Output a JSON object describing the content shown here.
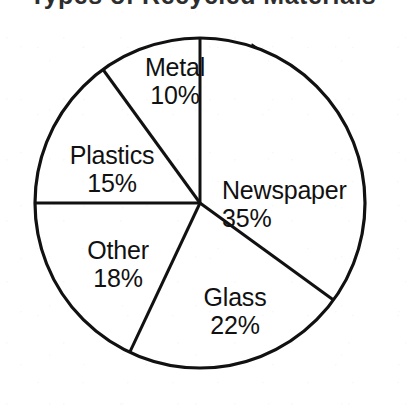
{
  "figure": {
    "title_fragment": "Types of Recycled Materials",
    "title_visible": false,
    "background_color": "#ffffff",
    "ink_color": "#111111"
  },
  "chart_data": {
    "type": "pie",
    "title": "",
    "xlabel": "",
    "ylabel": "",
    "grid": false,
    "legend": "none",
    "labels_inside_slices": true,
    "value_suffix": "%",
    "total": 100,
    "start_angle_deg": 0,
    "direction": "clockwise",
    "categories": [
      "Newspaper",
      "Glass",
      "Other",
      "Plastics",
      "Metal"
    ],
    "values": [
      35,
      22,
      18,
      15,
      10
    ],
    "slices": [
      {
        "name": "Newspaper",
        "value": 35,
        "value_label": "35%",
        "start_deg": 0,
        "end_deg": 126,
        "fill": "#ffffff",
        "stroke": "#111111"
      },
      {
        "name": "Glass",
        "value": 22,
        "value_label": "22%",
        "start_deg": 126,
        "end_deg": 205.2,
        "fill": "#ffffff",
        "stroke": "#111111"
      },
      {
        "name": "Other",
        "value": 18,
        "value_label": "18%",
        "start_deg": 205.2,
        "end_deg": 270,
        "fill": "#ffffff",
        "stroke": "#111111"
      },
      {
        "name": "Plastics",
        "value": 15,
        "value_label": "15%",
        "start_deg": 270,
        "end_deg": 324,
        "fill": "#ffffff",
        "stroke": "#111111"
      },
      {
        "name": "Metal",
        "value": 10,
        "value_label": "10%",
        "start_deg": 324,
        "end_deg": 360,
        "fill": "#ffffff",
        "stroke": "#111111"
      }
    ],
    "geometry": {
      "center_x": 200,
      "center_y": 203,
      "radius": 165,
      "shadow_arc": true,
      "shadow_max_width": 12
    }
  }
}
